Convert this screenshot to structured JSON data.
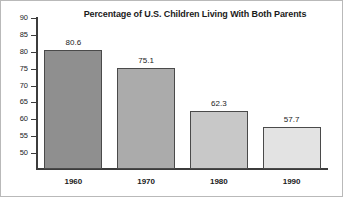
{
  "chart_data": {
    "type": "bar",
    "title": "Percentage of U.S. Children Living With Both Parents",
    "categories": [
      "1960",
      "1970",
      "1980",
      "1990"
    ],
    "values": [
      80.6,
      75.1,
      62.3,
      57.7
    ],
    "value_labels": [
      "80.6",
      "75.1",
      "62.3",
      "57.7"
    ],
    "xlabel": "",
    "ylabel": "",
    "ylim": [
      50,
      90
    ],
    "ytick_labels": [
      "90",
      "85",
      "80",
      "75",
      "70",
      "65",
      "60",
      "55",
      "50"
    ],
    "yticks": [
      90,
      85,
      80,
      75,
      70,
      65,
      60,
      55,
      50
    ],
    "grid": false,
    "legend": false,
    "bar_colors": [
      "#8f8f8f",
      "#ababab",
      "#c8c8c8",
      "#e3e3e3"
    ],
    "bar_outline_color": "#4a4a4a",
    "axis_color": "#3c3c3c",
    "background": "#ffffff",
    "text_color": "#1b1b1b"
  }
}
